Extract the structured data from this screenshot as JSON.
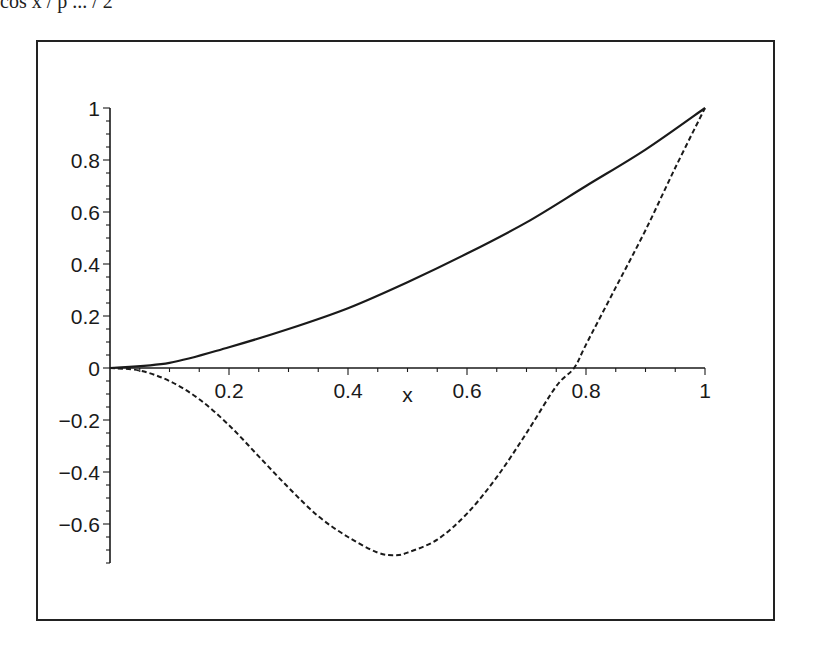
{
  "header": {
    "cut_text": "cos x / p  ...  / 2"
  },
  "chart_data": {
    "type": "line",
    "title": "",
    "xlabel": "x",
    "ylabel": "",
    "xlim": [
      0,
      1
    ],
    "ylim": [
      -0.75,
      1.0
    ],
    "grid": false,
    "legend": null,
    "x_ticks": [
      0.2,
      0.4,
      0.6,
      0.8,
      1
    ],
    "x_tick_labels": [
      "0.2",
      "0.4",
      "0.6",
      "0.8",
      "1"
    ],
    "y_ticks": [
      1,
      0.8,
      0.6,
      0.4,
      0.2,
      0,
      -0.2,
      -0.4,
      -0.6
    ],
    "y_tick_labels": [
      "1",
      "0.8",
      "0.6",
      "0.4",
      "0.2",
      "0",
      "−0.2",
      "−0.4",
      "−0.6"
    ],
    "series": [
      {
        "name": "solid curve",
        "style": "solid",
        "x": [
          0,
          0.1,
          0.2,
          0.3,
          0.4,
          0.5,
          0.6,
          0.7,
          0.8,
          0.9,
          1.0
        ],
        "y": [
          0,
          0.02,
          0.08,
          0.15,
          0.23,
          0.33,
          0.44,
          0.56,
          0.7,
          0.84,
          1.0
        ]
      },
      {
        "name": "dashed curve",
        "style": "dashed",
        "x": [
          0,
          0.05,
          0.1,
          0.15,
          0.2,
          0.25,
          0.3,
          0.35,
          0.4,
          0.45,
          0.48,
          0.5,
          0.55,
          0.6,
          0.65,
          0.7,
          0.75,
          0.78,
          0.8,
          0.85,
          0.9,
          0.95,
          1.0
        ],
        "y": [
          0,
          -0.01,
          -0.05,
          -0.12,
          -0.22,
          -0.34,
          -0.46,
          -0.57,
          -0.65,
          -0.71,
          -0.72,
          -0.71,
          -0.66,
          -0.56,
          -0.42,
          -0.25,
          -0.07,
          0.0,
          0.09,
          0.31,
          0.53,
          0.77,
          1.0
        ]
      }
    ]
  },
  "colors": {
    "line": "#1a1a1a",
    "frame": "#222222",
    "background": "#ffffff"
  }
}
